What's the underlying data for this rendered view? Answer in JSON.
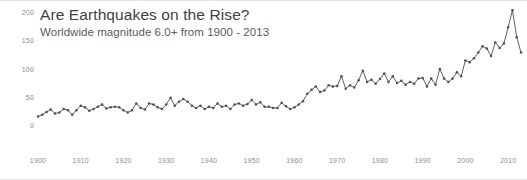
{
  "chart_data": {
    "type": "line",
    "title": "Are Earthquakes on the Rise?",
    "subtitle": "Worldwide magnitude 6.0+ from 1900 - 2013",
    "xlabel": "",
    "ylabel": "",
    "xlim": [
      1900,
      2013
    ],
    "ylim": [
      0,
      200
    ],
    "grid": false,
    "legend": null,
    "marker": "circle",
    "line_color": "#4d4d4d",
    "y_ticks": [
      200,
      150,
      100,
      50,
      0
    ],
    "x_ticks": [
      1900,
      1910,
      1920,
      1930,
      1940,
      1950,
      1960,
      1970,
      1980,
      1990,
      2000,
      2010
    ],
    "series": [
      {
        "name": "Worldwide magnitude 6.0+ earthquakes",
        "x": [
          1900,
          1901,
          1902,
          1903,
          1904,
          1905,
          1906,
          1907,
          1908,
          1909,
          1910,
          1911,
          1912,
          1913,
          1914,
          1915,
          1916,
          1917,
          1918,
          1919,
          1920,
          1921,
          1922,
          1923,
          1924,
          1925,
          1926,
          1927,
          1928,
          1929,
          1930,
          1931,
          1932,
          1933,
          1934,
          1935,
          1936,
          1937,
          1938,
          1939,
          1940,
          1941,
          1942,
          1943,
          1944,
          1945,
          1946,
          1947,
          1948,
          1949,
          1950,
          1951,
          1952,
          1953,
          1954,
          1955,
          1956,
          1957,
          1958,
          1959,
          1960,
          1961,
          1962,
          1963,
          1964,
          1965,
          1966,
          1967,
          1968,
          1969,
          1970,
          1971,
          1972,
          1973,
          1974,
          1975,
          1976,
          1977,
          1978,
          1979,
          1980,
          1981,
          1982,
          1983,
          1984,
          1985,
          1986,
          1987,
          1988,
          1989,
          1990,
          1991,
          1992,
          1993,
          1994,
          1995,
          1996,
          1997,
          1998,
          1999,
          2000,
          2001,
          2002,
          2003,
          2004,
          2005,
          2006,
          2007,
          2008,
          2009,
          2010,
          2011,
          2012,
          2013
        ],
        "values": [
          17,
          20,
          25,
          29,
          22,
          24,
          30,
          28,
          20,
          28,
          36,
          33,
          27,
          30,
          34,
          38,
          31,
          33,
          34,
          33,
          28,
          24,
          28,
          40,
          32,
          29,
          40,
          38,
          33,
          30,
          38,
          50,
          36,
          43,
          48,
          43,
          36,
          32,
          36,
          30,
          34,
          32,
          40,
          34,
          36,
          30,
          38,
          40,
          36,
          39,
          46,
          38,
          42,
          34,
          34,
          32,
          32,
          41,
          35,
          30,
          33,
          38,
          44,
          57,
          64,
          70,
          60,
          63,
          72,
          70,
          71,
          88,
          66,
          72,
          68,
          81,
          98,
          78,
          82,
          75,
          83,
          93,
          78,
          88,
          76,
          80,
          73,
          78,
          75,
          84,
          85,
          70,
          84,
          73,
          101,
          84,
          78,
          84,
          95,
          88,
          116,
          113,
          120,
          130,
          141,
          137,
          124,
          148,
          138,
          146,
          175,
          205,
          157,
          130
        ]
      }
    ]
  }
}
